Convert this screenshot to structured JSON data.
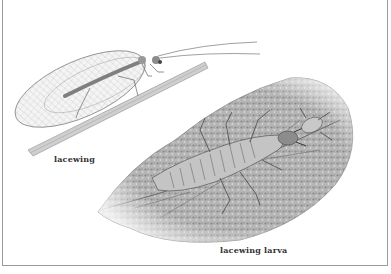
{
  "illustration": {
    "subjects": [
      {
        "name": "adult lacewing",
        "label": "lacewing"
      },
      {
        "name": "lacewing larva on leaf",
        "label": "lacewing larva"
      }
    ],
    "colors": {
      "ink": "#555555",
      "leaf": "#9a9a9a",
      "background": "#ffffff",
      "border": "#9a9a9a"
    }
  }
}
